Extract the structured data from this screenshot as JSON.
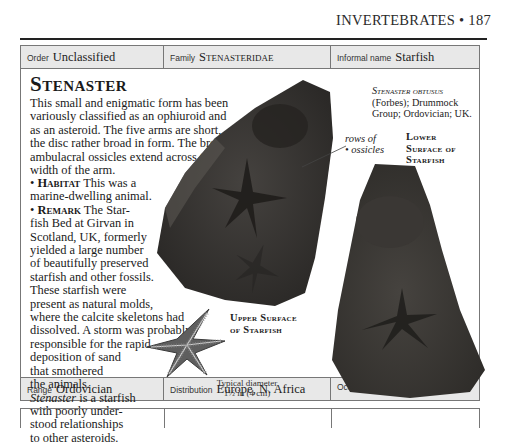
{
  "running_head": {
    "section": "INVERTEBRATES",
    "separator": "•",
    "page_number": "187"
  },
  "classification": {
    "order": {
      "label": "Order",
      "value": "Unclassified"
    },
    "family": {
      "label": "Family",
      "value": "Stenasteridae"
    },
    "informal_name": {
      "label": "Informal name",
      "value": "Starfish"
    }
  },
  "entry": {
    "title": "Stenaster",
    "intro": "This small and enigmatic form has been variously classified as an ophiuroid and as an asteroid. The five arms are short, the disc rather broad in form. The broad ambulacral ossicles extend across the width of the arm.",
    "habitat": {
      "bullet": "•",
      "heading": "Habitat",
      "lines": [
        "This was a",
        "marine-dwelling animal."
      ]
    },
    "remark": {
      "bullet": "•",
      "heading": "Remark",
      "lines": [
        "The Star-",
        "fish Bed at Girvan in",
        "Scotland, UK, formerly",
        "yielded a large number",
        "of beautifully preserved",
        "starfish and other fossils.",
        "These starfish were",
        "present as natural molds,",
        "where the calcite skeletons had",
        "dissolved. A storm was probably",
        "responsible for the rapid",
        "deposition of sand",
        "that smothered",
        "the animals."
      ]
    },
    "closing": {
      "genus_italic": "Stenaster",
      "lines": [
        " is a starfish",
        "with poorly under-",
        "stood relationships",
        "to other asteroids."
      ]
    }
  },
  "figures": {
    "specimen_caption": {
      "species": "Stenaster obtusus",
      "line2": "(Forbes); Drummock",
      "line3": "Group; Ordovician; UK."
    },
    "rows_label": {
      "line1": "rows of",
      "line2": "ossicles",
      "bullet": "•"
    },
    "lower_label": {
      "line1": "Lower",
      "line2": "Surface of",
      "line3": "Starfish"
    },
    "upper_label": {
      "line1": "Upper Surface",
      "line2": "of Starfish"
    },
    "diameter": {
      "line1": "Typical diameter",
      "line2": "1½ in (4 cm)"
    },
    "colors": {
      "rock": "#3a3836",
      "rock_dark": "#2a2826",
      "illustration": "#5a5a5a"
    }
  },
  "footer": {
    "range": {
      "label": "Range",
      "value": "Ordovician"
    },
    "distribution": {
      "label": "Distribution",
      "value": "Europe, N. Africa"
    },
    "occurrence": {
      "label": "Occurrence",
      "dots": 2
    }
  }
}
